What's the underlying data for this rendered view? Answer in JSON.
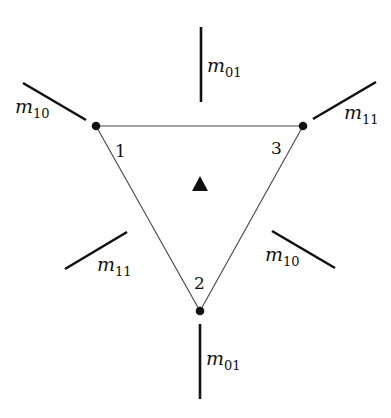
{
  "diagram": {
    "type": "triangle-with-edge-markers",
    "colors": {
      "line": "#111111",
      "edge": "#444444",
      "background": "#ffffff"
    },
    "vertices": [
      {
        "id": "1",
        "label": "1",
        "x": 96,
        "y": 126,
        "label_x": 115,
        "label_y": 157
      },
      {
        "id": "2",
        "label": "2",
        "x": 200,
        "y": 311,
        "label_x": 194,
        "label_y": 289
      },
      {
        "id": "3",
        "label": "3",
        "x": 303,
        "y": 126,
        "label_x": 271,
        "label_y": 154
      }
    ],
    "center_marker": {
      "shape": "filled-triangle",
      "x": 200,
      "y": 185
    },
    "segments": [
      {
        "name": "segment-top",
        "x1": 201,
        "y1": 27,
        "x2": 201,
        "y2": 102,
        "label_base": "m",
        "label_sub": "01",
        "lx": 207,
        "ly": 72
      },
      {
        "name": "segment-upper-left",
        "x1": 23,
        "y1": 83,
        "x2": 86,
        "y2": 120,
        "label_base": "m",
        "label_sub": "10",
        "lx": 15,
        "ly": 113
      },
      {
        "name": "segment-upper-right",
        "x1": 313,
        "y1": 119,
        "x2": 376,
        "y2": 82,
        "label_base": "m",
        "label_sub": "11",
        "lx": 344,
        "ly": 119
      },
      {
        "name": "segment-lower-left",
        "x1": 65,
        "y1": 269,
        "x2": 127,
        "y2": 232,
        "label_base": "m",
        "label_sub": "11",
        "lx": 97,
        "ly": 271
      },
      {
        "name": "segment-lower-right",
        "x1": 272,
        "y1": 231,
        "x2": 335,
        "y2": 268,
        "label_base": "m",
        "label_sub": "10",
        "lx": 265,
        "ly": 261
      },
      {
        "name": "segment-bottom",
        "x1": 200,
        "y1": 324,
        "x2": 200,
        "y2": 399,
        "label_base": "m",
        "label_sub": "01",
        "lx": 206,
        "ly": 365
      }
    ]
  }
}
